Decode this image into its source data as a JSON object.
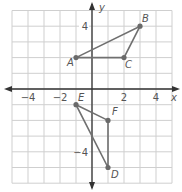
{
  "diagram": {
    "type": "coordinate-plane",
    "axes": {
      "x_label": "x",
      "y_label": "y",
      "x_ticks": [
        {
          "value": -4,
          "label": "−4"
        },
        {
          "value": -2,
          "label": "−2"
        },
        {
          "value": 2,
          "label": "2"
        },
        {
          "value": 4,
          "label": "4"
        }
      ],
      "y_ticks": [
        {
          "value": 4,
          "label": "4"
        },
        {
          "value": -4,
          "label": "−4"
        }
      ],
      "x_range": [
        -5,
        5
      ],
      "y_range": [
        -6,
        5
      ]
    },
    "figures": [
      {
        "name": "triangle-ABC",
        "vertices": [
          {
            "label": "A",
            "x": -1,
            "y": 2
          },
          {
            "label": "B",
            "x": 3,
            "y": 4
          },
          {
            "label": "C",
            "x": 2,
            "y": 2
          }
        ]
      },
      {
        "name": "triangle-DEF",
        "vertices": [
          {
            "label": "E",
            "x": -1,
            "y": -1
          },
          {
            "label": "F",
            "x": 1,
            "y": -2
          },
          {
            "label": "D",
            "x": 1,
            "y": -5
          }
        ]
      }
    ],
    "colors": {
      "grid": "#cfcfcf",
      "axis": "#333333",
      "figure": "#707070",
      "point": "#6a6a6a",
      "label": "#555555"
    }
  }
}
